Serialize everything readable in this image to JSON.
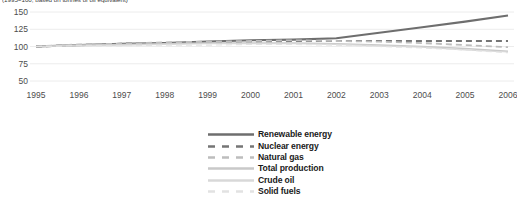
{
  "caption": "(1995=100, based on tonnes of oil equivalent)",
  "chart_data": {
    "type": "line",
    "title": "",
    "subtitle": "(1995=100, based on tonnes of oil equivalent)",
    "xlabel": "",
    "ylabel": "",
    "x": [
      1995,
      1996,
      1997,
      1998,
      1999,
      2000,
      2001,
      2002,
      2003,
      2004,
      2005,
      2006
    ],
    "xlim": [
      1995,
      2006
    ],
    "ylim": [
      50,
      150
    ],
    "yticks": [
      50,
      75,
      100,
      125,
      150
    ],
    "xticks": [
      "1995",
      "1996",
      "1997",
      "1998",
      "1999",
      "2000",
      "2001",
      "2002",
      "2003",
      "2004",
      "2005",
      "2006"
    ],
    "grid": true,
    "legend_position": "bottom",
    "series": [
      {
        "name": "Renewable energy",
        "color": "#6e6e6e",
        "style": "solid",
        "width": 2.1,
        "values": [
          100,
          102,
          104,
          105,
          107,
          109,
          110,
          112,
          120,
          128,
          136,
          145
        ]
      },
      {
        "name": "Nuclear energy",
        "color": "#757575",
        "style": "dashed",
        "width": 2.1,
        "values": [
          100,
          102,
          104,
          105,
          106,
          107,
          108,
          108,
          108,
          108,
          108,
          108
        ]
      },
      {
        "name": "Natural gas",
        "color": "#bdbdbd",
        "style": "dashed",
        "width": 1.8,
        "values": [
          100,
          103,
          104,
          106,
          107,
          108,
          109,
          108,
          107,
          105,
          102,
          99
        ]
      },
      {
        "name": "Total production",
        "color": "#c9c9c9",
        "style": "solid",
        "width": 1.5,
        "values": [
          100,
          102,
          103,
          104,
          105,
          105,
          105,
          104,
          102,
          100,
          97,
          93
        ]
      },
      {
        "name": "Crude oil",
        "color": "#d8d8d8",
        "style": "solid",
        "width": 1.2,
        "values": [
          100,
          101,
          102,
          103,
          104,
          104,
          104,
          103,
          101,
          99,
          95,
          92
        ]
      },
      {
        "name": "Solid fuels",
        "color": "#e2e2e2",
        "style": "dashed",
        "width": 1.2,
        "values": [
          100,
          101,
          101,
          102,
          102,
          103,
          103,
          102,
          100,
          98,
          95,
          91
        ]
      }
    ]
  },
  "yaxis": {
    "ticks": [
      "150",
      "125",
      "100",
      "75",
      "50"
    ]
  },
  "xaxis": {
    "ticks": [
      "1995",
      "1996",
      "1997",
      "1998",
      "1999",
      "2000",
      "2001",
      "2002",
      "2003",
      "2004",
      "2005",
      "2006"
    ]
  },
  "legend": {
    "items": [
      {
        "label": "Renewable energy"
      },
      {
        "label": "Nuclear energy"
      },
      {
        "label": "Natural gas"
      },
      {
        "label": "Total production"
      },
      {
        "label": "Crude oil"
      },
      {
        "label": "Solid fuels"
      }
    ]
  }
}
